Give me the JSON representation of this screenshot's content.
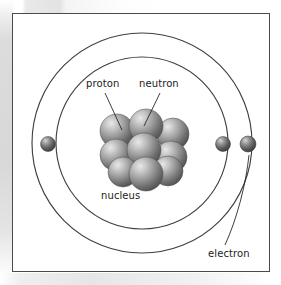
{
  "diagram": {
    "labels": {
      "proton": "proton",
      "neutron": "neutron",
      "nucleus": "nucleus",
      "electron": "electron"
    },
    "colors": {
      "frame_border": "#4a4a4a",
      "orbit_line": "#3f3f3f",
      "leader_line": "#1c1c1c",
      "particle_dark": "#4e4e4e",
      "particle_mid": "#8d8d8d",
      "particle_light": "#d8d8d8",
      "background": "#ffffff",
      "text": "#1c1c1c"
    },
    "orbits": [
      {
        "name": "inner-orbit",
        "cx": 129,
        "cy": 129,
        "r": 86
      },
      {
        "name": "outer-orbit",
        "cx": 129,
        "cy": 129,
        "r": 110
      }
    ],
    "electrons": [
      {
        "name": "electron-outer-left",
        "cx": 35,
        "cy": 130,
        "r": 7.5,
        "orbit": "outer-orbit"
      },
      {
        "name": "electron-inner-right",
        "cx": 210,
        "cy": 130,
        "r": 7.5,
        "orbit": "inner-orbit"
      },
      {
        "name": "electron-outer-right",
        "cx": 235,
        "cy": 130,
        "r": 8.0,
        "orbit": "outer-orbit"
      }
    ],
    "nucleons": [
      {
        "name": "nucleon-back-left",
        "cx": 104,
        "cy": 117,
        "r": 17
      },
      {
        "name": "nucleon-back-center",
        "cx": 133,
        "cy": 112,
        "r": 17
      },
      {
        "name": "nucleon-back-right",
        "cx": 160,
        "cy": 120,
        "r": 16
      },
      {
        "name": "nucleon-mid-left",
        "cx": 103,
        "cy": 141,
        "r": 16
      },
      {
        "name": "nucleon-mid-center",
        "cx": 131,
        "cy": 136,
        "r": 17
      },
      {
        "name": "nucleon-mid-right",
        "cx": 158,
        "cy": 143,
        "r": 16
      },
      {
        "name": "nucleon-front-left",
        "cx": 110,
        "cy": 158,
        "r": 15
      },
      {
        "name": "nucleon-front-center",
        "cx": 133,
        "cy": 160,
        "r": 17
      },
      {
        "name": "nucleon-front-right",
        "cx": 155,
        "cy": 157,
        "r": 15
      }
    ],
    "leader_lines": [
      {
        "name": "leader-proton",
        "x1": 92,
        "y1": 79,
        "x2": 109,
        "y2": 116
      },
      {
        "name": "leader-neutron",
        "x1": 147,
        "y1": 79,
        "x2": 131,
        "y2": 112
      },
      {
        "name": "leader-electron",
        "x1": 212,
        "y1": 231,
        "x2": 236,
        "y2": 141
      }
    ]
  }
}
